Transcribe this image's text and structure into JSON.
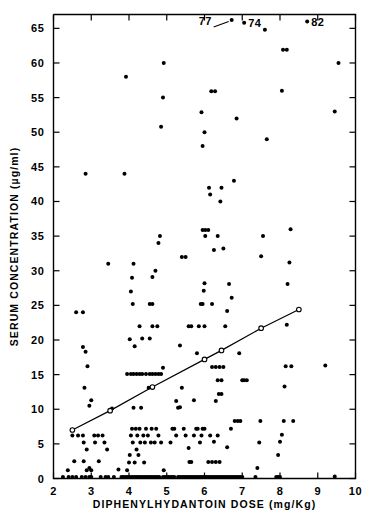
{
  "chart_data": {
    "type": "scatter",
    "title": "",
    "xlabel": "DIPHENYLHYDANTOIN DOSE (mg/Kg)",
    "ylabel": "SERUM CONCENTRATION (µg/ml)",
    "xlim": [
      2,
      10
    ],
    "ylim": [
      0,
      67
    ],
    "grid": false,
    "legend": "none",
    "xticks": [
      2,
      3,
      4,
      5,
      6,
      7,
      8,
      9,
      10
    ],
    "xtick_labels": [
      "2",
      "3",
      "4",
      "5",
      "6",
      "7",
      "8",
      "9",
      "10"
    ],
    "yticks": [
      0,
      5,
      10,
      15,
      20,
      25,
      30,
      35,
      40,
      45,
      50,
      55,
      60,
      65
    ],
    "ytick_labels": [
      "0",
      "5",
      "10",
      "15",
      "20",
      "25",
      "30",
      "35",
      "40",
      "45",
      "50",
      "55",
      "60",
      "65"
    ],
    "marker": "filled-circle",
    "marker_color": "#000000",
    "points": [
      [
        2.25,
        0.2
      ],
      [
        2.4,
        0.2
      ],
      [
        2.5,
        0.2
      ],
      [
        2.6,
        0.2
      ],
      [
        2.75,
        0.2
      ],
      [
        2.85,
        0.2
      ],
      [
        2.95,
        0.2
      ],
      [
        3.0,
        0.2
      ],
      [
        2.38,
        1.2
      ],
      [
        2.55,
        2.5
      ],
      [
        2.8,
        2.5
      ],
      [
        2.88,
        1.2
      ],
      [
        2.95,
        1.5
      ],
      [
        3.0,
        1.2
      ],
      [
        2.5,
        6.2
      ],
      [
        2.65,
        6.2
      ],
      [
        2.78,
        6.2
      ],
      [
        2.8,
        5.2
      ],
      [
        2.88,
        4.2
      ],
      [
        2.82,
        13.1
      ],
      [
        2.78,
        19.0
      ],
      [
        2.85,
        18.3
      ],
      [
        2.6,
        24.0
      ],
      [
        2.78,
        24.0
      ],
      [
        2.85,
        44.0
      ],
      [
        2.9,
        16.2
      ],
      [
        2.95,
        10.5
      ],
      [
        3.0,
        11.3
      ],
      [
        3.08,
        6.2
      ],
      [
        3.1,
        5.2
      ],
      [
        3.18,
        6.2
      ],
      [
        3.2,
        2.5
      ],
      [
        3.25,
        0.2
      ],
      [
        3.3,
        6.2
      ],
      [
        3.35,
        5.2
      ],
      [
        3.38,
        0.2
      ],
      [
        3.42,
        4.2
      ],
      [
        3.45,
        0.2
      ],
      [
        3.5,
        9.8
      ],
      [
        3.45,
        31.0
      ],
      [
        3.55,
        10.1
      ],
      [
        3.6,
        0.2
      ],
      [
        3.72,
        1.3
      ],
      [
        3.8,
        0.2
      ],
      [
        3.85,
        0.2
      ],
      [
        3.9,
        0.2
      ],
      [
        3.88,
        44.0
      ],
      [
        3.92,
        58.0
      ],
      [
        3.95,
        0.2
      ],
      [
        3.95,
        1.2
      ],
      [
        4.0,
        0.2
      ],
      [
        4.0,
        2.3
      ],
      [
        4.02,
        3.4
      ],
      [
        4.05,
        0.2
      ],
      [
        4.05,
        6.2
      ],
      [
        4.08,
        7.2
      ],
      [
        4.1,
        0.2
      ],
      [
        4.1,
        5.2
      ],
      [
        4.12,
        10.2
      ],
      [
        4.15,
        0.2
      ],
      [
        4.15,
        2.3
      ],
      [
        4.18,
        7.2
      ],
      [
        4.2,
        0.2
      ],
      [
        4.2,
        4.2
      ],
      [
        4.22,
        6.2
      ],
      [
        4.25,
        0.2
      ],
      [
        4.25,
        3.4
      ],
      [
        4.28,
        7.2
      ],
      [
        4.3,
        0.2
      ],
      [
        4.3,
        5.2
      ],
      [
        4.32,
        10.2
      ],
      [
        4.35,
        0.2
      ],
      [
        4.38,
        6.2
      ],
      [
        4.4,
        0.2
      ],
      [
        4.4,
        2.3
      ],
      [
        4.42,
        5.2
      ],
      [
        4.45,
        0.2
      ],
      [
        4.45,
        7.2
      ],
      [
        4.5,
        0.2
      ],
      [
        4.5,
        6.2
      ],
      [
        4.52,
        13.1
      ],
      [
        4.55,
        0.2
      ],
      [
        4.58,
        5.2
      ],
      [
        4.6,
        0.2
      ],
      [
        4.6,
        7.2
      ],
      [
        4.65,
        0.2
      ],
      [
        4.68,
        5.2
      ],
      [
        4.7,
        0.2
      ],
      [
        4.72,
        7.2
      ],
      [
        4.75,
        0.2
      ],
      [
        4.78,
        6.2
      ],
      [
        4.8,
        0.2
      ],
      [
        4.85,
        5.2
      ],
      [
        4.9,
        0.2
      ],
      [
        4.92,
        1.2
      ],
      [
        4.95,
        0.2
      ],
      [
        3.95,
        15.1
      ],
      [
        4.05,
        15.1
      ],
      [
        4.12,
        15.1
      ],
      [
        4.2,
        15.1
      ],
      [
        4.28,
        15.1
      ],
      [
        4.35,
        15.1
      ],
      [
        4.45,
        15.1
      ],
      [
        4.55,
        15.1
      ],
      [
        4.62,
        15.1
      ],
      [
        4.7,
        15.1
      ],
      [
        4.78,
        15.1
      ],
      [
        4.85,
        15.1
      ],
      [
        4.9,
        16.0
      ],
      [
        4.02,
        20.1
      ],
      [
        4.15,
        19.1
      ],
      [
        4.28,
        22.0
      ],
      [
        4.35,
        20.2
      ],
      [
        4.55,
        20.2
      ],
      [
        4.62,
        22.0
      ],
      [
        4.75,
        22.0
      ],
      [
        4.1,
        25.2
      ],
      [
        4.55,
        25.2
      ],
      [
        4.62,
        25.2
      ],
      [
        4.05,
        27.0
      ],
      [
        4.08,
        29.0
      ],
      [
        4.12,
        31.0
      ],
      [
        4.62,
        29.1
      ],
      [
        4.7,
        30.0
      ],
      [
        4.78,
        34.0
      ],
      [
        4.82,
        35.0
      ],
      [
        4.85,
        50.8
      ],
      [
        4.9,
        55.0
      ],
      [
        4.92,
        60.0
      ],
      [
        5.0,
        0.2
      ],
      [
        5.05,
        0.2
      ],
      [
        5.1,
        0.2
      ],
      [
        5.15,
        0.2
      ],
      [
        5.2,
        0.2
      ],
      [
        5.1,
        5.2
      ],
      [
        5.15,
        7.2
      ],
      [
        5.2,
        7.2
      ],
      [
        5.25,
        6.2
      ],
      [
        5.3,
        0.2
      ],
      [
        5.3,
        10.2
      ],
      [
        5.35,
        0.2
      ],
      [
        5.35,
        10.3
      ],
      [
        5.4,
        0.2
      ],
      [
        5.4,
        13.1
      ],
      [
        5.45,
        0.2
      ],
      [
        5.45,
        7.2
      ],
      [
        5.5,
        0.2
      ],
      [
        5.5,
        6.2
      ],
      [
        5.55,
        0.2
      ],
      [
        5.58,
        4.4
      ],
      [
        5.6,
        0.2
      ],
      [
        5.6,
        2.4
      ],
      [
        5.65,
        0.2
      ],
      [
        5.65,
        2.4
      ],
      [
        5.7,
        0.2
      ],
      [
        5.72,
        6.2
      ],
      [
        5.75,
        0.2
      ],
      [
        5.78,
        7.2
      ],
      [
        5.8,
        0.2
      ],
      [
        5.82,
        7.2
      ],
      [
        5.85,
        0.2
      ],
      [
        5.88,
        5.2
      ],
      [
        5.9,
        0.2
      ],
      [
        5.92,
        6.2
      ],
      [
        5.95,
        0.2
      ],
      [
        5.95,
        7.2
      ],
      [
        6.0,
        0.2
      ],
      [
        6.0,
        7.2
      ],
      [
        5.25,
        11.2
      ],
      [
        5.35,
        19.2
      ],
      [
        5.4,
        32.0
      ],
      [
        5.5,
        32.0
      ],
      [
        5.58,
        22.0
      ],
      [
        5.65,
        22.0
      ],
      [
        5.72,
        11.3
      ],
      [
        5.8,
        18.1
      ],
      [
        5.85,
        22.0
      ],
      [
        5.9,
        25.2
      ],
      [
        5.95,
        25.2
      ],
      [
        5.98,
        27.1
      ],
      [
        6.0,
        28.2
      ],
      [
        6.0,
        22.0
      ],
      [
        5.95,
        35.9
      ],
      [
        6.02,
        35.9
      ],
      [
        6.1,
        35.9
      ],
      [
        6.02,
        35.0
      ],
      [
        5.95,
        48.0
      ],
      [
        6.0,
        50.0
      ],
      [
        5.92,
        52.9
      ],
      [
        6.12,
        42.0
      ],
      [
        6.15,
        41.0
      ],
      [
        6.18,
        55.9
      ],
      [
        6.28,
        55.9
      ],
      [
        6.05,
        0.2
      ],
      [
        6.1,
        0.2
      ],
      [
        6.15,
        0.2
      ],
      [
        6.2,
        0.2
      ],
      [
        6.25,
        0.2
      ],
      [
        6.3,
        0.2
      ],
      [
        6.35,
        0.2
      ],
      [
        6.4,
        0.2
      ],
      [
        6.45,
        0.2
      ],
      [
        6.5,
        0.2
      ],
      [
        6.1,
        2.4
      ],
      [
        6.2,
        2.4
      ],
      [
        6.3,
        2.4
      ],
      [
        6.4,
        2.4
      ],
      [
        6.15,
        6.2
      ],
      [
        6.25,
        5.3
      ],
      [
        6.35,
        6.2
      ],
      [
        6.3,
        11.2
      ],
      [
        6.38,
        12.2
      ],
      [
        6.45,
        12.2
      ],
      [
        6.2,
        16.1
      ],
      [
        6.3,
        16.1
      ],
      [
        6.4,
        16.1
      ],
      [
        6.5,
        16.1
      ],
      [
        6.35,
        14.2
      ],
      [
        6.45,
        14.2
      ],
      [
        6.2,
        25.2
      ],
      [
        6.25,
        33.0
      ],
      [
        6.35,
        35.0
      ],
      [
        6.42,
        40.0
      ],
      [
        6.45,
        42.0
      ],
      [
        6.5,
        33.2
      ],
      [
        6.55,
        22.0
      ],
      [
        6.6,
        24.2
      ],
      [
        6.65,
        28.1
      ],
      [
        6.72,
        26.1
      ],
      [
        6.78,
        43.0
      ],
      [
        6.85,
        52.0
      ],
      [
        6.55,
        0.2
      ],
      [
        6.6,
        0.2
      ],
      [
        6.65,
        0.2
      ],
      [
        6.7,
        0.2
      ],
      [
        6.75,
        0.2
      ],
      [
        6.8,
        0.2
      ],
      [
        6.85,
        0.2
      ],
      [
        6.9,
        0.2
      ],
      [
        6.95,
        0.2
      ],
      [
        7.0,
        0.2
      ],
      [
        6.6,
        4.5
      ],
      [
        6.7,
        7.2
      ],
      [
        6.8,
        8.3
      ],
      [
        6.88,
        8.3
      ],
      [
        6.95,
        8.3
      ],
      [
        6.92,
        18.1
      ],
      [
        7.0,
        14.2
      ],
      [
        7.05,
        14.2
      ],
      [
        7.12,
        14.2
      ],
      [
        7.35,
        0.2
      ],
      [
        7.4,
        1.5
      ],
      [
        7.45,
        5.2
      ],
      [
        7.48,
        8.3
      ],
      [
        7.5,
        32.1
      ],
      [
        7.55,
        35.0
      ],
      [
        7.6,
        64.8
      ],
      [
        7.65,
        49.0
      ],
      [
        7.9,
        0.2
      ],
      [
        7.95,
        0.2
      ],
      [
        8.0,
        0.2
      ],
      [
        7.95,
        3.4
      ],
      [
        8.0,
        5.3
      ],
      [
        8.05,
        6.3
      ],
      [
        8.1,
        8.3
      ],
      [
        8.12,
        13.3
      ],
      [
        8.15,
        16.2
      ],
      [
        8.18,
        22.2
      ],
      [
        8.2,
        28.1
      ],
      [
        8.25,
        31.2
      ],
      [
        8.28,
        36.0
      ],
      [
        8.05,
        56.0
      ],
      [
        8.08,
        61.9
      ],
      [
        8.18,
        61.9
      ],
      [
        8.3,
        16.2
      ],
      [
        8.35,
        8.3
      ],
      [
        9.2,
        16.3
      ],
      [
        9.45,
        0.3
      ],
      [
        9.45,
        53.0
      ],
      [
        9.55,
        60.0
      ]
    ],
    "annotated_points": [
      {
        "label": "77",
        "x": 6.72,
        "y": 66.2,
        "leader": true
      },
      {
        "label": "74",
        "x": 7.05,
        "y": 65.8,
        "leader": false
      },
      {
        "label": "82",
        "x": 8.72,
        "y": 66.0,
        "leader": false
      }
    ],
    "fit_line": {
      "description": "regression line with open-circle nodes",
      "marker": "open-circle",
      "nodes": [
        [
          2.5,
          7.0
        ],
        [
          3.5,
          9.8
        ],
        [
          4.62,
          13.2
        ],
        [
          6.0,
          17.2
        ],
        [
          6.45,
          18.5
        ],
        [
          7.5,
          21.7
        ],
        [
          8.5,
          24.4
        ]
      ]
    }
  }
}
